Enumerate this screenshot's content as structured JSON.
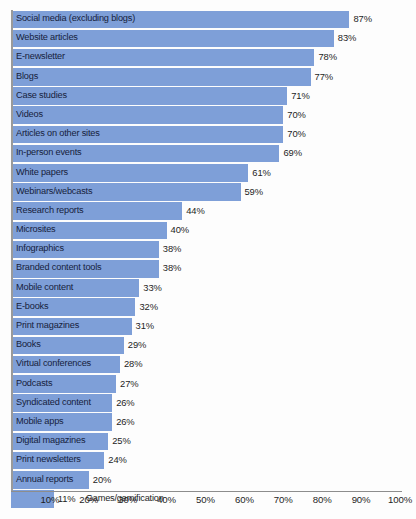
{
  "chart_data": {
    "type": "bar",
    "orientation": "horizontal",
    "title": "",
    "subtitle": "",
    "xlabel": "",
    "ylabel": "",
    "xlim": [
      0,
      100
    ],
    "grid": false,
    "legend": null,
    "value_suffix": "%",
    "axis_tick_labels": [
      "10%",
      "20%",
      "30%",
      "40%",
      "50%",
      "60%",
      "70%",
      "80%",
      "90%",
      "100%"
    ],
    "axis_tick_values": [
      10,
      20,
      30,
      40,
      50,
      60,
      70,
      80,
      90,
      100
    ],
    "bar_color": "#7e9fd8",
    "categories": [
      "Social media (excluding blogs)",
      "Website articles",
      "E-newsletter",
      "Blogs",
      "Case studies",
      "Videos",
      "Articles on other sites",
      "In-person events",
      "White papers",
      "Webinars/webcasts",
      "Research reports",
      "Microsites",
      "Infographics",
      "Branded content tools",
      "Mobile content",
      "E-books",
      "Print magazines",
      "Books",
      "Virtual conferences",
      "Podcasts",
      "Syndicated content",
      "Mobile apps",
      "Digital magazines",
      "Print newsletters",
      "Annual reports",
      "Games/gamification"
    ],
    "values": [
      87,
      83,
      78,
      77,
      71,
      70,
      70,
      69,
      61,
      59,
      44,
      40,
      38,
      38,
      33,
      32,
      31,
      29,
      28,
      27,
      26,
      26,
      25,
      24,
      20,
      11
    ],
    "value_labels": [
      "87%",
      "83%",
      "78%",
      "77%",
      "71%",
      "70%",
      "70%",
      "69%",
      "61%",
      "59%",
      "44%",
      "40%",
      "38%",
      "38%",
      "33%",
      "32%",
      "31%",
      "29%",
      "28%",
      "27%",
      "26%",
      "26%",
      "25%",
      "24%",
      "20%",
      "11%"
    ],
    "label_outside_bar": [
      false,
      false,
      false,
      false,
      false,
      false,
      false,
      false,
      false,
      false,
      false,
      false,
      false,
      false,
      false,
      false,
      false,
      false,
      false,
      false,
      false,
      false,
      false,
      false,
      false,
      true
    ]
  }
}
